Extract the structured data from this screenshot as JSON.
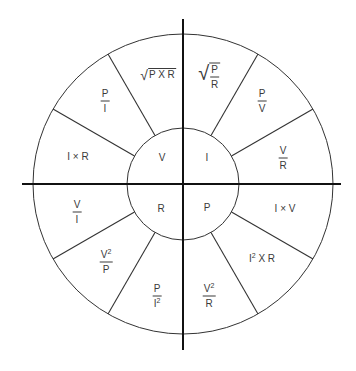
{
  "diagram": {
    "center": {
      "x": 183,
      "y": 184
    },
    "outer_radius": 150,
    "inner_radius": 56,
    "colors": {
      "line": "#333333",
      "axis": "#111111",
      "text": "#3a3a3a",
      "background": "#ffffff"
    },
    "inner": {
      "V": "V",
      "I": "I",
      "R": "R",
      "P": "P"
    },
    "sectors": {
      "sqrt_p_times_r": {
        "radicand": "P X R"
      },
      "sqrt_p_over_r": {
        "num": "P",
        "den": "R"
      },
      "p_over_i": {
        "num": "P",
        "den": "I"
      },
      "p_over_v": {
        "num": "P",
        "den": "V"
      },
      "i_times_r": {
        "text": "I × R"
      },
      "v_over_r": {
        "num": "V",
        "den": "R"
      },
      "v_over_i": {
        "num": "V",
        "den": "I"
      },
      "i_times_v": {
        "text": "I × V"
      },
      "v2_over_p": {
        "num": "V",
        "num_sup": "2",
        "den": "P"
      },
      "i2_times_r": {
        "base": "I",
        "sup": "2",
        "rest": " X R"
      },
      "p_over_i2": {
        "num": "P",
        "den": "I",
        "den_sup": "2"
      },
      "v2_over_r": {
        "num": "V",
        "num_sup": "2",
        "den": "R"
      }
    }
  }
}
